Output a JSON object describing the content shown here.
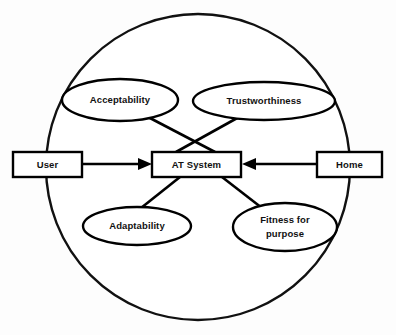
{
  "diagram": {
    "background_color": "#fdfdfd",
    "stroke_color": "#000000",
    "fill_color": "#ffffff",
    "boundary": {
      "name": "context-boundary",
      "shape": "circle",
      "cx": 198,
      "cy": 167,
      "rx": 152,
      "ry": 153
    },
    "nodes": [
      {
        "id": "at-system",
        "label": "AT System",
        "shape": "rectangle",
        "x": 152,
        "y": 152,
        "width": 89,
        "height": 25
      },
      {
        "id": "user",
        "label": "User",
        "shape": "rectangle",
        "x": 13,
        "y": 152,
        "width": 69,
        "height": 25
      },
      {
        "id": "home",
        "label": "Home",
        "shape": "rectangle",
        "x": 317,
        "y": 152,
        "width": 65,
        "height": 25
      },
      {
        "id": "acceptability",
        "label": "Acceptability",
        "shape": "ellipse",
        "cx": 120,
        "cy": 100,
        "rx": 58,
        "ry": 21
      },
      {
        "id": "trustworthiness",
        "label": "Trustworthiness",
        "shape": "ellipse",
        "cx": 264,
        "cy": 101,
        "rx": 71,
        "ry": 19
      },
      {
        "id": "adaptability",
        "label": "Adaptability",
        "shape": "ellipse",
        "cx": 137,
        "cy": 226,
        "rx": 54,
        "ry": 19
      },
      {
        "id": "fitness-for-purpose",
        "label": "Fitness for purpose",
        "label_lines": [
          "Fitness for",
          "purpose"
        ],
        "shape": "ellipse",
        "cx": 285,
        "cy": 227,
        "rx": 52,
        "ry": 24
      }
    ],
    "edges": [
      {
        "id": "user-to-at-system",
        "from": "user",
        "to": "at-system",
        "arrow": "target",
        "x1": 82,
        "y1": 164,
        "x2": 150,
        "y2": 164
      },
      {
        "id": "home-to-at-system",
        "from": "home",
        "to": "at-system",
        "arrow": "target",
        "x1": 317,
        "y1": 164,
        "x2": 244,
        "y2": 164
      },
      {
        "id": "acceptability-to-at-system",
        "from": "acceptability",
        "to": "at-system",
        "arrow": "none",
        "x1": 148,
        "y1": 117,
        "x2": 215,
        "y2": 152
      },
      {
        "id": "trustworthiness-to-at-system",
        "from": "trustworthiness",
        "to": "at-system",
        "arrow": "none",
        "x1": 239,
        "y1": 117,
        "x2": 176,
        "y2": 152
      },
      {
        "id": "at-system-to-adaptability",
        "from": "at-system",
        "to": "adaptability",
        "arrow": "none",
        "x1": 180,
        "y1": 177,
        "x2": 141,
        "y2": 208
      },
      {
        "id": "at-system-to-fitness",
        "from": "at-system",
        "to": "fitness-for-purpose",
        "arrow": "none",
        "x1": 222,
        "y1": 177,
        "x2": 262,
        "y2": 208
      }
    ]
  }
}
